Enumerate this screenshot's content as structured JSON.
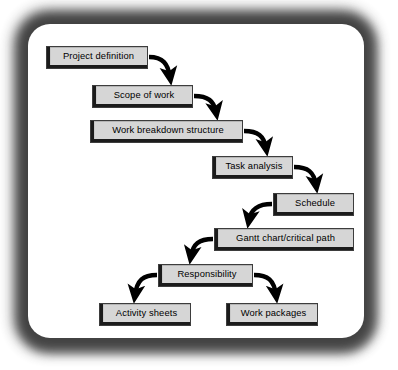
{
  "diagram": {
    "style": {
      "box_fill": "#d6d6d6",
      "box_edge": "#1b1b1b",
      "arrow_color": "#000000",
      "panel_background": "#ffffff",
      "frame_color": "#4a4a4a"
    },
    "nodes": [
      {
        "id": "project-definition",
        "label": "Project definition",
        "x": 46,
        "y": 46,
        "w": 102,
        "h": 23
      },
      {
        "id": "scope-of-work",
        "label": "Scope of work",
        "x": 92,
        "y": 85,
        "w": 101,
        "h": 23
      },
      {
        "id": "work-breakdown",
        "label": "Work breakdown structure",
        "x": 90,
        "y": 120,
        "w": 153,
        "h": 23
      },
      {
        "id": "task-analysis",
        "label": "Task analysis",
        "x": 212,
        "y": 156,
        "w": 81,
        "h": 23
      },
      {
        "id": "schedule",
        "label": "Schedule",
        "x": 273,
        "y": 193,
        "w": 81,
        "h": 23
      },
      {
        "id": "gantt-critical-path",
        "label": "Gantt chart/critical path",
        "x": 214,
        "y": 228,
        "w": 140,
        "h": 23
      },
      {
        "id": "responsibility",
        "label": "Responsibility",
        "x": 158,
        "y": 264,
        "w": 95,
        "h": 23
      },
      {
        "id": "activity-sheets",
        "label": "Activity sheets",
        "x": 99,
        "y": 303,
        "w": 92,
        "h": 23
      },
      {
        "id": "work-packages",
        "label": "Work packages",
        "x": 226,
        "y": 303,
        "w": 92,
        "h": 23
      }
    ],
    "edges": [
      {
        "id": "e1",
        "from": "project-definition",
        "to": "scope-of-work",
        "direction": "right-down"
      },
      {
        "id": "e2",
        "from": "scope-of-work",
        "to": "work-breakdown",
        "direction": "right-down"
      },
      {
        "id": "e3",
        "from": "work-breakdown",
        "to": "task-analysis",
        "direction": "right-down"
      },
      {
        "id": "e4",
        "from": "task-analysis",
        "to": "schedule",
        "direction": "right-down"
      },
      {
        "id": "e5",
        "from": "schedule",
        "to": "gantt-critical-path",
        "direction": "left-down"
      },
      {
        "id": "e6",
        "from": "gantt-critical-path",
        "to": "responsibility",
        "direction": "left-down"
      },
      {
        "id": "e7",
        "from": "responsibility",
        "to": "activity-sheets",
        "direction": "left-down"
      },
      {
        "id": "e8",
        "from": "responsibility",
        "to": "work-packages",
        "direction": "right-down"
      }
    ]
  }
}
